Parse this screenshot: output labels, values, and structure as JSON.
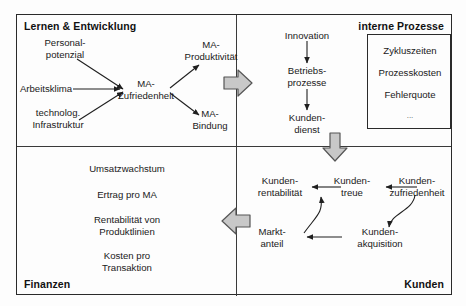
{
  "diagram": {
    "type": "strategy-map",
    "colors": {
      "line": "#2a2a2a",
      "arrow_fill": "#c8c8c8",
      "arrow_stroke": "#555555",
      "background": "#fdfdfd",
      "text": "#1a1a1a"
    }
  },
  "quadrants": {
    "learning": {
      "title": "Lernen & Entwicklung",
      "title_position": "top-left",
      "nodes": [
        {
          "id": "personalpotenzial",
          "label": "Personal-\npotenzial",
          "line1": "Personal-",
          "line2": "potenzial"
        },
        {
          "id": "arbeitsklima",
          "label": "Arbeitsklima",
          "line1": "Arbeitsklima",
          "line2": ""
        },
        {
          "id": "technolog-infrastruktur",
          "label": "technolog.\nInfrastruktur",
          "line1": "technolog.",
          "line2": "Infrastruktur"
        },
        {
          "id": "ma-zufriedenheit",
          "label": "MA-\nZufriedenheit",
          "line1": "MA-",
          "line2": "Zufriedenheit"
        },
        {
          "id": "ma-produktivitaet",
          "label": "MA-\nProduktivität",
          "line1": "MA-",
          "line2": "Produktivität"
        },
        {
          "id": "ma-bindung",
          "label": "MA-\nBindung",
          "line1": "MA-",
          "line2": "Bindung"
        }
      ]
    },
    "processes": {
      "title": "interne Prozesse",
      "title_position": "top-right",
      "nodes": [
        {
          "id": "innovation",
          "label": "Innovation",
          "line1": "Innovation",
          "line2": ""
        },
        {
          "id": "betriebsprozesse",
          "label": "Betriebs-\nprozesse",
          "line1": "Betriebs-",
          "line2": "prozesse"
        },
        {
          "id": "kundendienst",
          "label": "Kunden-\ndienst",
          "line1": "Kunden-",
          "line2": "dienst"
        }
      ],
      "kpi_box": {
        "items": [
          "Zykluszeiten",
          "Prozesskosten",
          "Fehlerquote",
          "..."
        ]
      }
    },
    "finance": {
      "title": "Finanzen",
      "title_position": "bottom-left",
      "nodes": [
        {
          "id": "umsatzwachstum",
          "label": "Umsatzwachstum",
          "line1": "Umsatzwachstum",
          "line2": ""
        },
        {
          "id": "ertrag-pro-ma",
          "label": "Ertrag pro MA",
          "line1": "Ertrag pro MA",
          "line2": ""
        },
        {
          "id": "rentabilitaet-produktlinien",
          "label": "Rentabilität von\nProduktlinien",
          "line1": "Rentabilität von",
          "line2": "Produktlinien"
        },
        {
          "id": "kosten-pro-transaktion",
          "label": "Kosten pro\nTransaktion",
          "line1": "Kosten pro",
          "line2": "Transaktion"
        }
      ]
    },
    "customers": {
      "title": "Kunden",
      "title_position": "bottom-right",
      "nodes": [
        {
          "id": "kundenrentabilitaet",
          "label": "Kunden-\nrentabilität",
          "line1": "Kunden-",
          "line2": "rentabilität"
        },
        {
          "id": "kundentreue",
          "label": "Kunden-\ntreue",
          "line1": "Kunden-",
          "line2": "treue"
        },
        {
          "id": "kundenzufriedenheit",
          "label": "Kunden-\nzufriedenheit",
          "line1": "Kunden-",
          "line2": "zufriedenheit"
        },
        {
          "id": "marktanteil",
          "label": "Markt-\nanteil",
          "line1": "Markt-",
          "line2": "anteil"
        },
        {
          "id": "kundenakquisition",
          "label": "Kunden-\nakquisition",
          "line1": "Kunden-",
          "line2": "akquisition"
        }
      ]
    }
  },
  "connectors": {
    "block_arrows": [
      {
        "id": "learning-to-processes",
        "direction": "right"
      },
      {
        "id": "processes-to-customers",
        "direction": "down"
      },
      {
        "id": "customers-to-finance",
        "direction": "left"
      }
    ]
  }
}
